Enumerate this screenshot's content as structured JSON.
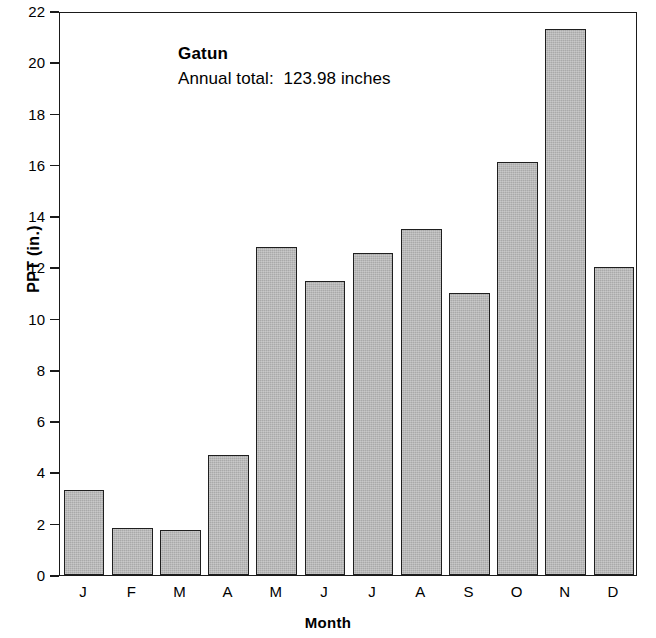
{
  "chart_data": {
    "type": "bar",
    "title": "Gatun",
    "subtitle": "Annual total:  123.98 inches",
    "xlabel": "Month",
    "ylabel": "PPT (in.)",
    "categories": [
      "J",
      "F",
      "M",
      "A",
      "M",
      "J",
      "J",
      "A",
      "S",
      "O",
      "N",
      "D"
    ],
    "values": [
      3.3,
      1.85,
      1.75,
      4.7,
      12.8,
      11.45,
      12.55,
      13.5,
      11.0,
      16.1,
      21.3,
      12.0
    ],
    "ylim": [
      0,
      22
    ],
    "ytick_step": 2,
    "yticks": [
      0,
      2,
      4,
      6,
      8,
      10,
      12,
      14,
      16,
      18,
      20,
      22
    ],
    "ytick_labels": [
      "0",
      "2",
      "4",
      "6",
      "8",
      "10",
      "12",
      "14",
      "16",
      "18",
      "20",
      "22"
    ],
    "grid": false,
    "legend": null,
    "bar_fill_color": "#a9a9a9",
    "bar_edge_color": "#1f1f1f",
    "axis_color": "#1a1a1a",
    "background_color": "#ffffff"
  },
  "annotation": {
    "station_name": "Gatun",
    "annual_total_text": "Annual total:  123.98 inches",
    "annual_total_value": 123.98,
    "annual_total_units": "inches"
  }
}
